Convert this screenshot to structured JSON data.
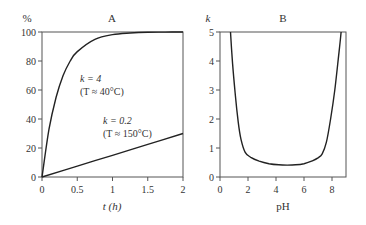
{
  "chart_data": [
    {
      "panel": "A",
      "type": "line",
      "title": "A",
      "xlabel": "t (h)",
      "ylabel": "%",
      "xlim": [
        0,
        2
      ],
      "ylim": [
        0,
        100
      ],
      "xticks": [
        "0",
        "0.5",
        "1",
        "1.5",
        "2"
      ],
      "yticks": [
        "0",
        "20",
        "40",
        "60",
        "80",
        "100"
      ],
      "grid": false,
      "series": [
        {
          "name": "k = 4 (T ≈ 40°C)",
          "x": [
            0,
            0.1,
            0.2,
            0.3,
            0.4,
            0.5,
            0.75,
            1.0,
            1.25,
            1.5,
            1.75,
            2.0
          ],
          "values": [
            0,
            33,
            55,
            70,
            80,
            86.5,
            95,
            98.2,
            99.3,
            99.8,
            99.9,
            100
          ]
        },
        {
          "name": "k = 0.2 (T ≈ 150°C)",
          "x": [
            0,
            0.5,
            1.0,
            1.5,
            2.0
          ],
          "values": [
            0,
            7.5,
            15,
            22.5,
            30
          ]
        }
      ],
      "annotations": [
        {
          "label_k": "k = 4",
          "label_T": "(T ≈ 40°C)"
        },
        {
          "label_k": "k = 0.2",
          "label_T": "(T ≈ 150°C)"
        }
      ]
    },
    {
      "panel": "B",
      "type": "line",
      "title": "B",
      "xlabel": "pH",
      "ylabel": "k",
      "xlim": [
        0,
        9
      ],
      "ylim": [
        0,
        5
      ],
      "xticks": [
        "0",
        "2",
        "4",
        "6",
        "8"
      ],
      "yticks": [
        "0",
        "1",
        "2",
        "3",
        "4",
        "5"
      ],
      "grid": false,
      "series": [
        {
          "name": "k vs pH",
          "x": [
            0.75,
            0.9,
            1.1,
            1.3,
            1.5,
            1.8,
            2.2,
            2.8,
            3.5,
            4.2,
            4.8,
            5.4,
            6.0,
            6.6,
            7.0,
            7.3,
            7.6,
            7.9,
            8.2,
            8.5,
            8.65
          ],
          "values": [
            5.0,
            3.9,
            2.8,
            1.9,
            1.3,
            0.85,
            0.68,
            0.55,
            0.46,
            0.42,
            0.41,
            0.42,
            0.46,
            0.56,
            0.66,
            0.8,
            1.2,
            2.0,
            3.0,
            4.3,
            5.0
          ]
        }
      ]
    }
  ]
}
